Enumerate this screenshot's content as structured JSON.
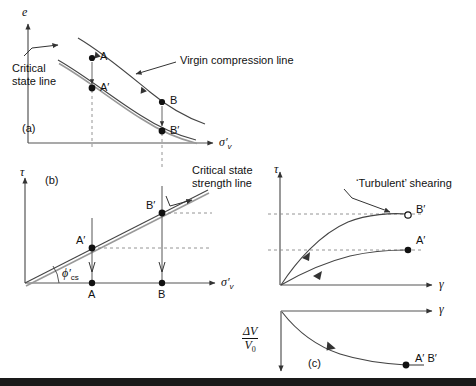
{
  "figure": {
    "panels": {
      "a": {
        "tag": "(a)",
        "y_axis_label": "e",
        "x_axis_label": "σ′",
        "x_axis_label_sub": "v",
        "annotations": [
          {
            "name": "virgin-compression-line",
            "text": "Virgin compression line"
          },
          {
            "name": "critical-state-line",
            "line1": "Critical",
            "line2": "state line"
          }
        ],
        "points": [
          {
            "id": "A",
            "label": "A"
          },
          {
            "id": "A2",
            "label": "A′"
          },
          {
            "id": "B",
            "label": "B"
          },
          {
            "id": "B2",
            "label": "B′"
          }
        ]
      },
      "b": {
        "tag": "(b)",
        "y_axis_label": "τ",
        "x_axis_label": "σ′",
        "x_axis_label_sub": "v",
        "angle_label": "ϕ′",
        "angle_label_sub": "cs",
        "annotations": [
          {
            "name": "critical-state-strength-line",
            "line1": "Critical state",
            "line2": "strength line"
          }
        ],
        "points": [
          {
            "id": "A",
            "label": "A"
          },
          {
            "id": "B",
            "label": "B"
          },
          {
            "id": "A2",
            "label": "A′"
          },
          {
            "id": "B2",
            "label": "B′"
          }
        ]
      },
      "shear": {
        "y_axis_label": "τ",
        "x_axis_label": "γ",
        "annotations": [
          {
            "name": "turbulent-shearing",
            "text": "‘Turbulent’ shearing"
          }
        ],
        "points": [
          {
            "id": "B2",
            "label": "B′"
          },
          {
            "id": "A2",
            "label": "A′"
          }
        ]
      },
      "c": {
        "tag": "(c)",
        "x_axis_label": "γ",
        "y_axis_num": "ΔV",
        "y_axis_den": "V",
        "y_axis_den_sub": "0",
        "points": [
          {
            "id": "A2B2",
            "label": "A′ B′"
          }
        ]
      }
    },
    "colors": {
      "line": "#222222",
      "axis": "#555555",
      "dashed": "#777777",
      "band": "#1a1a1a",
      "text": "#111111"
    }
  }
}
